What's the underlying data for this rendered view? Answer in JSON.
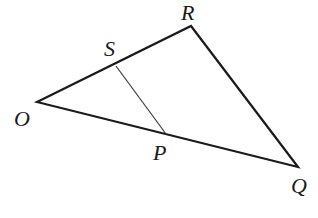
{
  "diagram": {
    "type": "triangle",
    "points": {
      "O": {
        "x": 37,
        "y": 102,
        "label": "O",
        "label_x": 14,
        "label_y": 126
      },
      "R": {
        "x": 191,
        "y": 26,
        "label": "R",
        "label_x": 181,
        "label_y": 20
      },
      "Q": {
        "x": 298,
        "y": 167,
        "label": "Q",
        "label_x": 291,
        "label_y": 193
      },
      "S": {
        "x": 116,
        "y": 66,
        "label": "S",
        "label_x": 104,
        "label_y": 56
      },
      "P": {
        "x": 166,
        "y": 134,
        "label": "P",
        "label_x": 153,
        "label_y": 160
      }
    },
    "edges": [
      {
        "from": "O",
        "to": "R"
      },
      {
        "from": "R",
        "to": "Q"
      },
      {
        "from": "O",
        "to": "Q"
      }
    ],
    "segments": [
      {
        "from": "S",
        "to": "P"
      }
    ],
    "colors": {
      "stroke": "#1a1a1a",
      "background": "#ffffff"
    }
  }
}
